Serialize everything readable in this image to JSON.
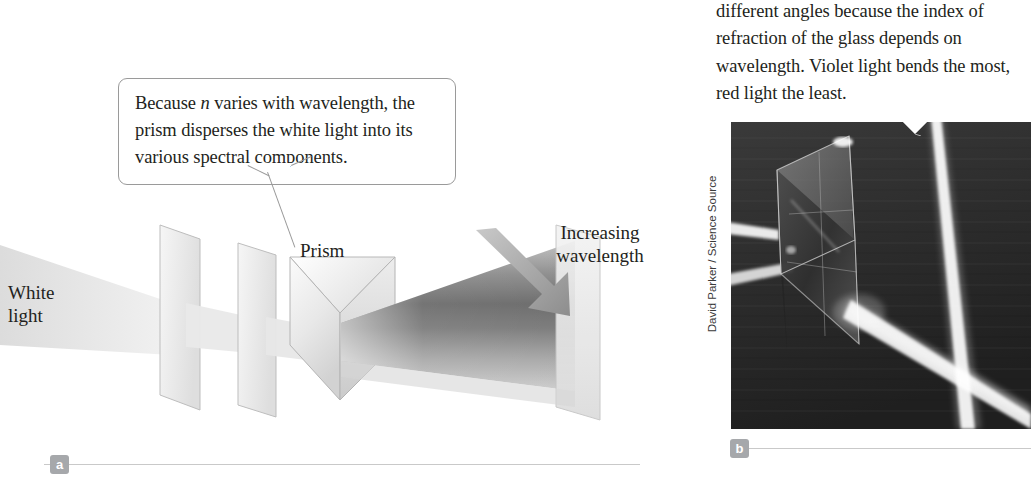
{
  "figure": {
    "panel_a": {
      "badge": "a",
      "callout": "Because n varies with wavelength, the prism disperses the white light into its various spectral components.",
      "callout_parts": {
        "before": "Because ",
        "variable": "n",
        "after": " varies with wavelength, the prism disperses the white light into its various spectral components."
      },
      "labels": {
        "white_light": "White\nlight",
        "prism": "Prism",
        "increasing_wavelength": "Increasing\nwavelength"
      },
      "arrow_name": "increasing-wavelength-arrow",
      "arrow_direction": "down-right"
    },
    "panel_b": {
      "badge": "b",
      "caption": "different angles because the index of refraction of the glass depends on wavelength. Violet light bends the most, red light the least.",
      "photo_credit": "David Parker / Science Source",
      "photo_description": "Photograph of a glass prism dispersing a beam of white light"
    }
  },
  "colors": {
    "text": "#231f20",
    "rule": "#c9c9c9",
    "badge_bg": "#a6a8ab",
    "badge_text": "#ffffff",
    "callout_border": "#9a9a9a",
    "arrow": "#9a9a9a",
    "photo_dark": "#2b2b2b",
    "page_bg": "#ffffff"
  }
}
